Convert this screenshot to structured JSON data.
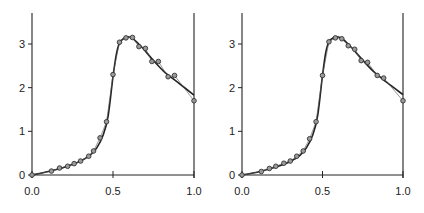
{
  "figure": {
    "background": "#ffffff",
    "line_color": "#222222",
    "marker_fill": "#9a9a9a",
    "marker_stroke": "#333333"
  },
  "chart_data": [
    {
      "type": "scatter",
      "panel": "left",
      "title": "",
      "xlabel": "",
      "ylabel": "",
      "xlim": [
        0.0,
        1.0
      ],
      "ylim": [
        0.0,
        3.7
      ],
      "xticks": [
        "0.0",
        "0.5",
        "1.0"
      ],
      "yticks": [
        "0",
        "1",
        "2",
        "3"
      ],
      "grid": false,
      "series": [
        {
          "name": "observed",
          "style": "markers connected by thin line",
          "x": [
            0.0,
            0.12,
            0.17,
            0.22,
            0.26,
            0.3,
            0.35,
            0.38,
            0.42,
            0.46,
            0.5,
            0.54,
            0.58,
            0.62,
            0.66,
            0.7,
            0.74,
            0.78,
            0.84,
            0.88,
            1.0
          ],
          "y": [
            0.0,
            0.09,
            0.16,
            0.2,
            0.26,
            0.32,
            0.43,
            0.55,
            0.85,
            1.22,
            2.3,
            3.04,
            3.14,
            3.15,
            2.94,
            2.9,
            2.6,
            2.6,
            2.25,
            2.28,
            1.7
          ]
        },
        {
          "name": "fitted",
          "style": "thick smooth curve",
          "x": [
            0.0,
            0.1,
            0.2,
            0.3,
            0.36,
            0.4,
            0.44,
            0.47,
            0.5,
            0.52,
            0.54,
            0.57,
            0.6,
            0.63,
            0.68,
            0.75,
            0.82,
            0.9,
            1.0
          ],
          "y": [
            0.0,
            0.08,
            0.18,
            0.32,
            0.46,
            0.62,
            0.92,
            1.35,
            2.25,
            2.75,
            3.02,
            3.14,
            3.16,
            3.1,
            2.92,
            2.62,
            2.35,
            2.12,
            1.83
          ]
        }
      ]
    },
    {
      "type": "scatter",
      "panel": "right",
      "title": "",
      "xlabel": "",
      "ylabel": "",
      "xlim": [
        0.0,
        1.0
      ],
      "ylim": [
        0.0,
        3.7
      ],
      "xticks": [
        "0.0",
        "0.5",
        "1.0"
      ],
      "yticks": [
        "0",
        "1",
        "2",
        "3"
      ],
      "grid": false,
      "series": [
        {
          "name": "observed",
          "style": "markers connected by thin line",
          "x": [
            0.0,
            0.12,
            0.17,
            0.21,
            0.26,
            0.3,
            0.34,
            0.38,
            0.42,
            0.46,
            0.5,
            0.54,
            0.58,
            0.62,
            0.66,
            0.7,
            0.74,
            0.78,
            0.84,
            0.88,
            1.0
          ],
          "y": [
            0.0,
            0.08,
            0.15,
            0.2,
            0.27,
            0.32,
            0.43,
            0.55,
            0.83,
            1.22,
            2.28,
            3.05,
            3.14,
            3.12,
            2.96,
            2.88,
            2.62,
            2.58,
            2.28,
            2.22,
            1.7
          ]
        },
        {
          "name": "fitted",
          "style": "thick smooth curve",
          "x": [
            0.0,
            0.1,
            0.2,
            0.3,
            0.36,
            0.4,
            0.44,
            0.47,
            0.5,
            0.52,
            0.54,
            0.57,
            0.6,
            0.63,
            0.68,
            0.75,
            0.82,
            0.9,
            1.0
          ],
          "y": [
            0.0,
            0.07,
            0.17,
            0.31,
            0.45,
            0.62,
            0.92,
            1.36,
            2.28,
            2.8,
            3.05,
            3.15,
            3.16,
            3.1,
            2.92,
            2.63,
            2.36,
            2.12,
            1.84
          ]
        }
      ]
    }
  ],
  "panels": [
    {
      "box": {
        "x0": 32,
        "x1": 194,
        "y0": 175,
        "ytop": 13
      }
    },
    {
      "box": {
        "x0": 242,
        "x1": 403,
        "y0": 175,
        "ytop": 13
      }
    }
  ]
}
